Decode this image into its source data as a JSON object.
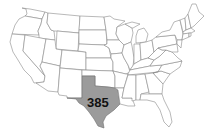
{
  "map": {
    "type": "choropleth-outline",
    "region": "United States (contiguous)",
    "highlighted_state": {
      "name": "Texas",
      "value": "385",
      "fill_color": "#9b9b9b"
    },
    "base_fill_color": "#ffffff",
    "border_color": "#8a8a8a",
    "label_color": "#111111"
  }
}
